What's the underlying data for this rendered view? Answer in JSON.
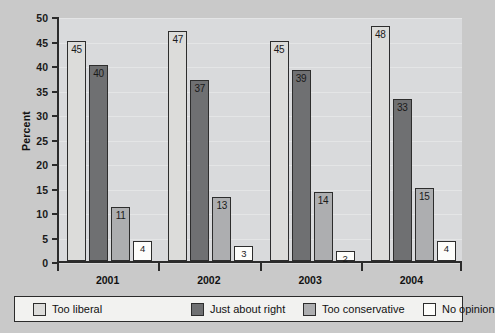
{
  "chart_data": {
    "type": "bar",
    "title": "",
    "subtitle": "",
    "xlabel": "",
    "ylabel": "Percent",
    "categories": [
      "2001",
      "2002",
      "2003",
      "2004"
    ],
    "ylim": [
      0,
      50
    ],
    "yticks": [
      0,
      5,
      10,
      15,
      20,
      25,
      30,
      35,
      40,
      45,
      50
    ],
    "ytick_labels": [
      "0",
      "5",
      "10",
      "15",
      "20",
      "25",
      "30",
      "35",
      "40",
      "45",
      "50"
    ],
    "grid": false,
    "legend_position": "bottom",
    "series": [
      {
        "name": "Too liberal",
        "color": "#dcdcda",
        "values": [
          45,
          47,
          45,
          48
        ],
        "labels": [
          "45",
          "47",
          "45",
          "48"
        ]
      },
      {
        "name": "Just about right",
        "color": "#6f7072",
        "values": [
          40,
          37,
          39,
          33
        ],
        "labels": [
          "40",
          "37",
          "39",
          "33"
        ]
      },
      {
        "name": "Too conservative",
        "color": "#adaeb0",
        "values": [
          11,
          13,
          14,
          15
        ],
        "labels": [
          "11",
          "13",
          "14",
          "15"
        ]
      },
      {
        "name": "No opinion",
        "color": "#fdfdfb",
        "values": [
          4,
          3,
          2,
          4
        ],
        "labels": [
          "4",
          "3",
          "2",
          "4"
        ]
      }
    ]
  },
  "axis": {
    "y_title": "Percent"
  },
  "legend": {
    "items": [
      {
        "label": "Too liberal",
        "color": "#dcdcda"
      },
      {
        "label": "Just about right",
        "color": "#6f7072"
      },
      {
        "label": "Too conservative",
        "color": "#adaeb0"
      },
      {
        "label": "No opinion",
        "color": "#fdfdfb"
      }
    ]
  },
  "colors": {
    "figure_background": "#c9c9c9",
    "plot_background": "#d9dadc",
    "axis": "#2b2b2b",
    "bar_outline": "#2d2d2d",
    "legend_background": "#f2f2f0"
  }
}
